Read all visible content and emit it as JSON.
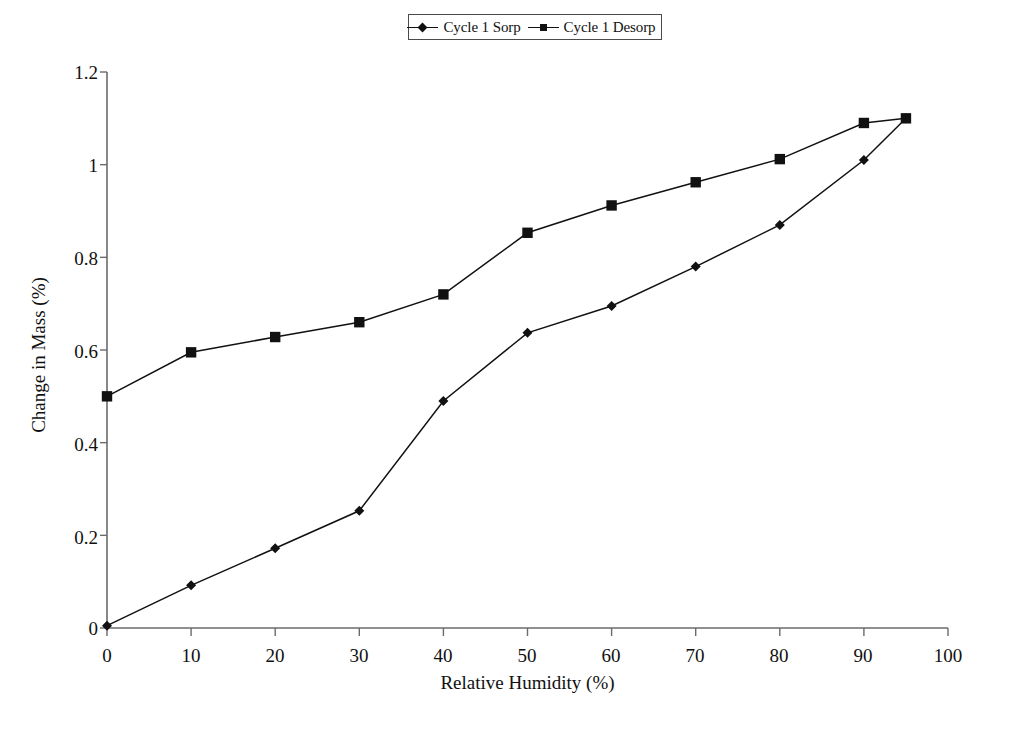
{
  "chart_data": {
    "type": "line",
    "title": "",
    "xlabel": "Relative Humidity (%)",
    "ylabel": "Change in Mass (%)",
    "xlim": [
      0,
      100
    ],
    "ylim": [
      0,
      1.2
    ],
    "xticks": [
      "0",
      "10",
      "20",
      "30",
      "40",
      "50",
      "60",
      "70",
      "80",
      "90",
      "100"
    ],
    "yticks": [
      "0",
      "0.2",
      "0.4",
      "0.6",
      "0.8",
      "1",
      "1.2"
    ],
    "grid": false,
    "legend_position": "top-center",
    "series": [
      {
        "name": "Cycle 1  Sorp",
        "marker": "diamond",
        "x": [
          0,
          10,
          20,
          30,
          40,
          50,
          60,
          70,
          80,
          90,
          95
        ],
        "values": [
          0.005,
          0.092,
          0.172,
          0.253,
          0.49,
          0.637,
          0.695,
          0.78,
          0.87,
          1.01,
          1.1
        ]
      },
      {
        "name": "Cycle 1  Desorp",
        "marker": "square",
        "x": [
          0,
          10,
          20,
          30,
          40,
          50,
          60,
          70,
          80,
          90,
          95
        ],
        "values": [
          0.5,
          0.595,
          0.628,
          0.66,
          0.72,
          0.853,
          0.912,
          0.962,
          1.012,
          1.09,
          1.1
        ]
      }
    ]
  },
  "legend": {
    "entries": [
      {
        "label": "Cycle 1  Sorp",
        "marker": "diamond-marker-icon"
      },
      {
        "label": "Cycle 1  Desorp",
        "marker": "square-marker-icon"
      }
    ]
  },
  "axes": {
    "y_title": "Change in Mass (%)",
    "x_title": "Relative Humidity (%)",
    "y_tick_labels": [
      "1.2",
      "1",
      "0.8",
      "0.6",
      "0.4",
      "0.2",
      "0"
    ],
    "x_tick_labels": [
      "0",
      "10",
      "20",
      "30",
      "40",
      "50",
      "60",
      "70",
      "80",
      "90",
      "100"
    ]
  },
  "colors": {
    "line": "#111111",
    "marker": "#111111",
    "axis": "#6b6b6b",
    "background": "#ffffff"
  }
}
